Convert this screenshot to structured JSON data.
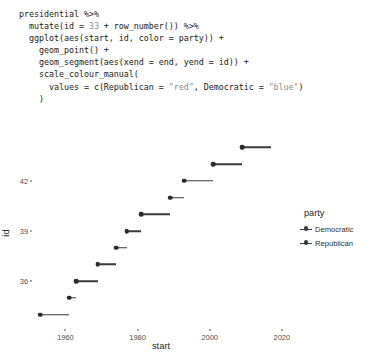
{
  "code": {
    "language": "r",
    "lines": [
      [
        {
          "t": "presidential %>%"
        }
      ],
      [
        {
          "t": "  mutate(id = "
        },
        {
          "t": "33",
          "c": "lit"
        },
        {
          "t": " + row_number()) %>%"
        }
      ],
      [
        {
          "t": "  ggplot(aes(start, id, color = party)) +"
        }
      ],
      [
        {
          "t": "    geom_point() +"
        }
      ],
      [
        {
          "t": "    geom_segment(aes(xend = end, yend = id)) +"
        }
      ],
      [
        {
          "t": "    scale_colour_manual("
        }
      ],
      [
        {
          "t": "      values = c(Republican = "
        },
        {
          "t": "\"red\"",
          "c": "str"
        },
        {
          "t": ", Democratic = "
        },
        {
          "t": "\"blue\"",
          "c": "str"
        },
        {
          "t": ")"
        }
      ],
      [
        {
          "t": "    )"
        }
      ]
    ]
  },
  "chart_data": {
    "type": "scatter",
    "title": "",
    "xlabel": "start",
    "ylabel": "id",
    "xlim": [
      1951,
      2022
    ],
    "ylim": [
      33.2,
      45.4
    ],
    "grid": false,
    "xticks": [
      1960,
      1980,
      2000,
      2020
    ],
    "xtick_labels": [
      "1960",
      "1980",
      "2000",
      "2020"
    ],
    "yticks": [
      36,
      39,
      42
    ],
    "ytick_labels": [
      "36",
      "39",
      "42"
    ],
    "legend": {
      "title": "party",
      "position": "right",
      "entries": [
        {
          "label": "Democratic",
          "color": "#3a3a3a"
        },
        {
          "label": "Republican",
          "color": "#3a3a3a"
        }
      ]
    },
    "points": [
      {
        "id": 34,
        "start": 1953,
        "end": 1961,
        "party": "Republican"
      },
      {
        "id": 35,
        "start": 1961,
        "end": 1963,
        "party": "Democratic"
      },
      {
        "id": 36,
        "start": 1963,
        "end": 1969,
        "party": "Democratic"
      },
      {
        "id": 37,
        "start": 1969,
        "end": 1974,
        "party": "Republican"
      },
      {
        "id": 38,
        "start": 1974,
        "end": 1977,
        "party": "Republican"
      },
      {
        "id": 39,
        "start": 1977,
        "end": 1981,
        "party": "Democratic"
      },
      {
        "id": 40,
        "start": 1981,
        "end": 1989,
        "party": "Republican"
      },
      {
        "id": 41,
        "start": 1989,
        "end": 1993,
        "party": "Republican"
      },
      {
        "id": 42,
        "start": 1993,
        "end": 2001,
        "party": "Democratic"
      },
      {
        "id": 43,
        "start": 2001,
        "end": 2009,
        "party": "Republican"
      },
      {
        "id": 44,
        "start": 2009,
        "end": 2017,
        "party": "Democratic"
      }
    ]
  }
}
